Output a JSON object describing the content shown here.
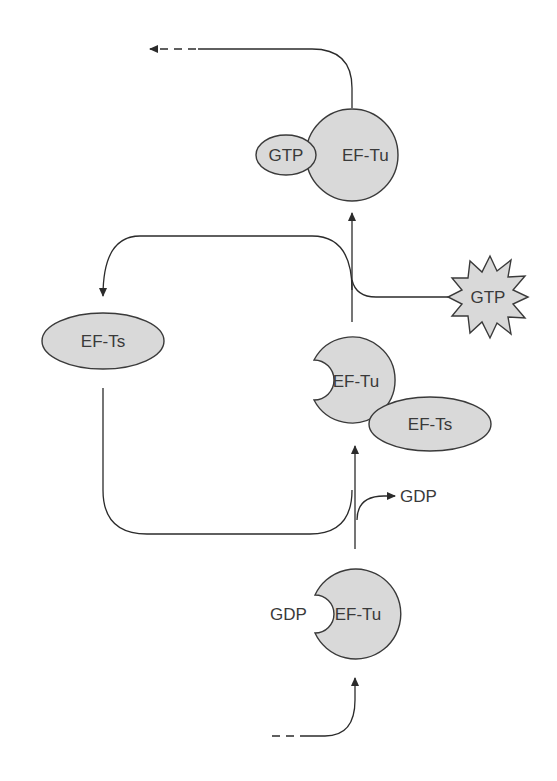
{
  "diagram": {
    "colors": {
      "fill": "#d9d9d9",
      "stroke": "#3a3a3a",
      "text": "#3a3a3a"
    },
    "nodes": {
      "top_complex": {
        "protein": "EF-Tu",
        "bound": "GTP"
      },
      "free_efts": {
        "label": "EF-Ts"
      },
      "gtp_input": {
        "label": "GTP"
      },
      "middle_complex": {
        "protein": "EF-Tu",
        "partner": "EF-Ts"
      },
      "gdp_release": {
        "label": "GDP"
      },
      "bottom_complex": {
        "protein": "EF-Tu",
        "bound": "GDP"
      }
    }
  }
}
